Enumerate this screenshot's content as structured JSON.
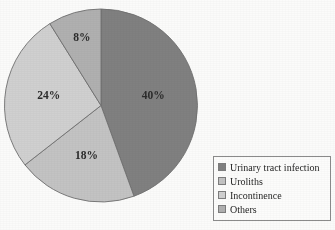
{
  "chart_data": {
    "type": "pie",
    "title": "",
    "categories": [
      "Urinary tract infection",
      "Uroliths",
      "Incontinence",
      "Others"
    ],
    "values": [
      40,
      18,
      24,
      8
    ],
    "value_labels": [
      "40%",
      "18%",
      "24%",
      "8%"
    ],
    "unit": "%",
    "start_angle_deg": 0,
    "direction": "clockwise",
    "legend_position": "bottom-right",
    "grid": false,
    "colors": [
      "#808080",
      "#c3c3c3",
      "#d0d0d0",
      "#b0b0b0"
    ],
    "slices": [
      {
        "label": "Urinary tract infection",
        "value": 40,
        "value_label": "40%",
        "color": "#808080"
      },
      {
        "label": "Uroliths",
        "value": 18,
        "value_label": "18%",
        "color": "#c3c3c3"
      },
      {
        "label": "Incontinence",
        "value": 24,
        "value_label": "d0d0d0-placeholder",
        "color": "#d0d0d0"
      },
      {
        "label": "Others",
        "value": 8,
        "value_label": "8%",
        "color": "#b0b0b0"
      }
    ]
  },
  "pie": {
    "labels": {
      "slice_0": "40%",
      "slice_1": "18%",
      "slice_2": "24%",
      "slice_3": "8%"
    }
  },
  "legend": {
    "items": [
      {
        "label": "Urinary tract infection",
        "color": "#808080"
      },
      {
        "label": "Uroliths",
        "color": "#c3c3c3"
      },
      {
        "label": "Incontinence",
        "color": "#d0d0d0"
      },
      {
        "label": "Others",
        "color": "#b0b0b0"
      }
    ]
  }
}
